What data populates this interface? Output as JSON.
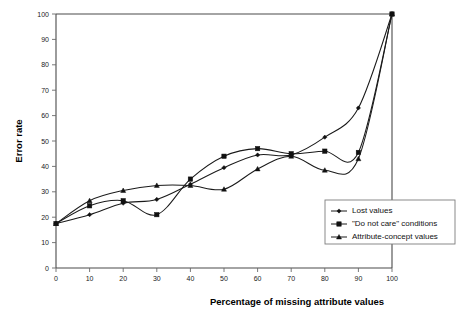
{
  "chart_data": {
    "type": "line",
    "title": "",
    "xlabel": "Percentage of missing attribute values",
    "ylabel": "Error rate",
    "xlim": [
      0,
      100
    ],
    "ylim": [
      0,
      100
    ],
    "grid": false,
    "legend_position": "inside-bottom-right",
    "x": [
      0,
      10,
      20,
      30,
      40,
      50,
      60,
      70,
      80,
      90,
      100
    ],
    "xticks": [
      "0",
      "10",
      "20",
      "30",
      "40",
      "50",
      "60",
      "70",
      "80",
      "90",
      "100"
    ],
    "yticks": [
      "0",
      "10",
      "20",
      "30",
      "40",
      "50",
      "60",
      "70",
      "80",
      "90",
      "100"
    ],
    "series": [
      {
        "name": "Lost values",
        "marker": "diamond",
        "values": [
          17.5,
          21,
          25.5,
          27,
          33,
          39.5,
          44.5,
          44.5,
          51.5,
          63,
          100
        ]
      },
      {
        "name": "\"Do not care\" conditions",
        "marker": "square",
        "values": [
          17.5,
          24.5,
          26.5,
          21,
          35,
          44,
          47,
          45,
          46,
          45.5,
          100
        ]
      },
      {
        "name": "Attribute-concept values",
        "marker": "triangle",
        "values": [
          17.5,
          26.5,
          30.5,
          32.5,
          32.5,
          31,
          39,
          44,
          38.5,
          43,
          100
        ]
      }
    ]
  },
  "legend": {
    "entries": [
      "Lost values",
      "\"Do not care\" conditions",
      "Attribute-concept values"
    ]
  },
  "colors": {
    "line": "#1a1a1a",
    "axis": "#4a4a4a",
    "background": "#ffffff"
  }
}
